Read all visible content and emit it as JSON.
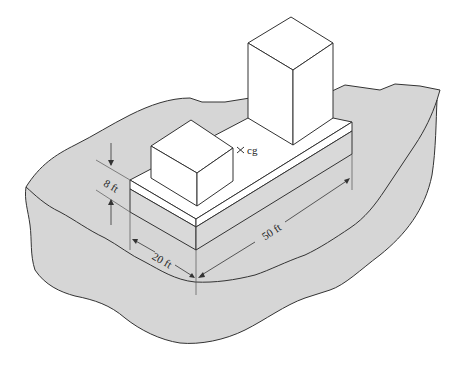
{
  "figure": {
    "type": "isometric structural diagram"
  },
  "labels": {
    "height": "8 ft",
    "width": "20 ft",
    "length": "50 ft",
    "center_of_gravity": "cg"
  },
  "colors": {
    "ground": "#d6d6d6",
    "platform_side": "#d9d9d9",
    "box_face": "#ffffff",
    "stroke": "#333333"
  }
}
